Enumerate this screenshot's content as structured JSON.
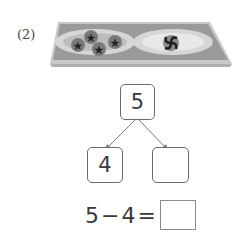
{
  "problem": {
    "label": "(2)",
    "image": {
      "description": "tray-with-two-plates",
      "left_plate": {
        "items": 4,
        "item_icon": "star-candy-icon"
      },
      "right_plate": {
        "items": 1,
        "item_icon": "swirl-candy-icon"
      }
    },
    "number_bond": {
      "whole": "5",
      "part_left": "4",
      "part_right": ""
    },
    "equation": {
      "operand1": "5",
      "operator": "−",
      "operand2": "4",
      "equals": "=",
      "answer": ""
    }
  },
  "colors": {
    "tray": "#9a9a9a",
    "tray_border": "#c8c8c8",
    "plate": "#d6d6d6",
    "candy": "#5e5e5e",
    "box_border": "#6b6b6b"
  }
}
